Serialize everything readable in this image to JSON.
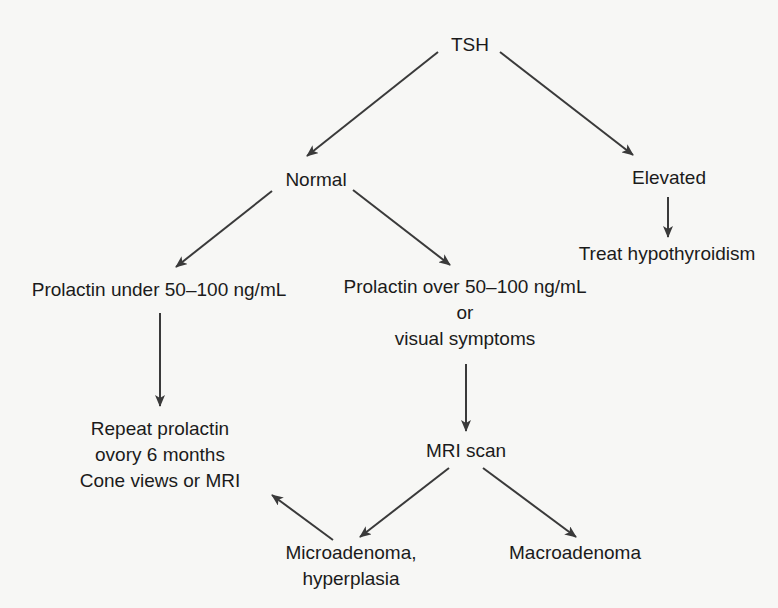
{
  "diagram": {
    "type": "flowchart",
    "colors": {
      "background": "#f7f7f5",
      "text": "#1b1b1b",
      "arrow": "#3a3a3a"
    },
    "nodes": {
      "tsh": {
        "label": "TSH"
      },
      "normal": {
        "label": "Normal"
      },
      "elevated": {
        "label": "Elevated"
      },
      "treat_hypothyroidism": {
        "label": "Treat hypothyroidism"
      },
      "prolactin_under": {
        "label": "Prolactin under 50–100 ng/mL"
      },
      "prolactin_over": {
        "lines": [
          "Prolactin over 50–100 ng/mL",
          "or",
          "visual symptoms"
        ]
      },
      "repeat_prolactin": {
        "lines": [
          "Repeat prolactin",
          "ovory 6 months",
          "Cone views or MRI"
        ]
      },
      "mri_scan": {
        "label": "MRI scan"
      },
      "microadenoma": {
        "lines": [
          "Microadenoma,",
          "hyperplasia"
        ]
      },
      "macroadenoma": {
        "label": "Macroadenoma"
      }
    },
    "edges": [
      {
        "from": "tsh",
        "to": "normal"
      },
      {
        "from": "tsh",
        "to": "elevated"
      },
      {
        "from": "elevated",
        "to": "treat_hypothyroidism"
      },
      {
        "from": "normal",
        "to": "prolactin_under"
      },
      {
        "from": "normal",
        "to": "prolactin_over"
      },
      {
        "from": "prolactin_under",
        "to": "repeat_prolactin"
      },
      {
        "from": "prolactin_over",
        "to": "mri_scan"
      },
      {
        "from": "mri_scan",
        "to": "microadenoma"
      },
      {
        "from": "mri_scan",
        "to": "macroadenoma"
      },
      {
        "from": "microadenoma",
        "to": "repeat_prolactin"
      }
    ]
  }
}
